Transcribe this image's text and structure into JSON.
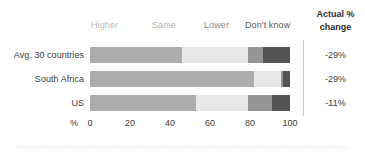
{
  "right_header": {
    "line1": "Actual %",
    "line2": "change"
  },
  "axis": {
    "unit_label": "%",
    "ticks": [
      "0",
      "20",
      "40",
      "60",
      "80",
      "100"
    ],
    "tick_values": [
      0,
      20,
      40,
      60,
      80,
      100
    ],
    "min": 0,
    "max": 100
  },
  "legend": [
    {
      "label": "Higher",
      "color": "#adadad",
      "text_color": "#bdbdbd"
    },
    {
      "label": "Same",
      "color": "#e8e8e8",
      "text_color": "#b0b0b0"
    },
    {
      "label": "Lower",
      "color": "#969696",
      "text_color": "#8a8a8a"
    },
    {
      "label": "Don't know",
      "color": "#545454",
      "text_color": "#5a5a5a"
    }
  ],
  "rows": [
    {
      "label": "Avg. 30 countries",
      "actual_change": "-29%",
      "values": [
        46,
        33,
        7.5,
        13.5
      ]
    },
    {
      "label": "South Africa",
      "actual_change": "-29%",
      "values": [
        82,
        13.5,
        1,
        3.5
      ]
    },
    {
      "label": "US",
      "actual_change": "-11%",
      "values": [
        53,
        26,
        12,
        9
      ]
    }
  ],
  "chart_data": {
    "type": "bar",
    "orientation": "horizontal",
    "stacked": true,
    "stacked_percent": true,
    "title": "",
    "subtitle": "",
    "xlabel": "%",
    "ylabel": "",
    "xlim": [
      0,
      100
    ],
    "xticks": [
      0,
      20,
      40,
      60,
      80,
      100
    ],
    "grid": false,
    "legend_position": "top",
    "categories": [
      "Avg. 30 countries",
      "South Africa",
      "US"
    ],
    "series": [
      {
        "name": "Higher",
        "color": "#adadad",
        "values": [
          46,
          82,
          53
        ]
      },
      {
        "name": "Same",
        "color": "#e8e8e8",
        "values": [
          33,
          13.5,
          26
        ]
      },
      {
        "name": "Lower",
        "color": "#969696",
        "values": [
          7.5,
          1,
          12
        ]
      },
      {
        "name": "Don't know",
        "color": "#545454",
        "values": [
          13.5,
          3.5,
          9
        ]
      }
    ],
    "annotations": {
      "column_header": "Actual % change",
      "column_values": [
        "-29%",
        "-29%",
        "-11%"
      ]
    }
  }
}
